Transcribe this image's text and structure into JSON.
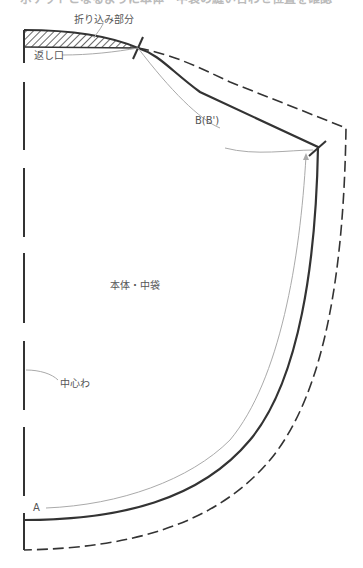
{
  "header": {
    "cut_off_text": "ポケットとなるように本体・中袋の縫い合わせ位置を確認"
  },
  "labels": {
    "fold_in_part": "折り込み部分",
    "return_opening": "返し口",
    "point_b": "B(B')",
    "main_body": "本体・中袋",
    "center_fold": "中心わ",
    "point_a": "A"
  },
  "colors": {
    "line": "#333333",
    "leader": "#aaaaaa",
    "label": "#555555",
    "hatch": "#444444"
  }
}
